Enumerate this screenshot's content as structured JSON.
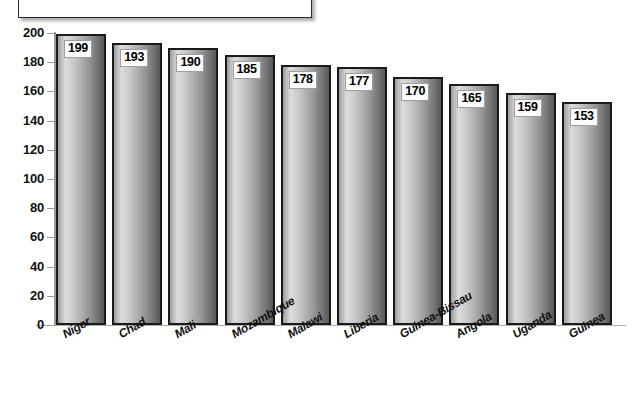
{
  "title_box": {
    "text": ""
  },
  "footnote": {
    "text": ""
  },
  "chart_data": {
    "type": "bar",
    "title": "",
    "subtitle": "",
    "xlabel": "",
    "ylabel": "",
    "categories": [
      "Niger",
      "Chad",
      "Mali",
      "Mozambique",
      "Malawi",
      "Liberia",
      "Guinea-Bissau",
      "Angola",
      "Uganda",
      "Guinea"
    ],
    "values": [
      199,
      193,
      190,
      185,
      178,
      177,
      170,
      165,
      159,
      153
    ],
    "data_labels": [
      "199",
      "193",
      "190",
      "185",
      "178",
      "177",
      "170",
      "165",
      "159",
      "153"
    ],
    "ylim": [
      0,
      200
    ],
    "ytick_labels": [
      "200",
      "180",
      "160",
      "140",
      "120",
      "100",
      "80",
      "60",
      "40",
      "20",
      "0"
    ],
    "ytick_values": [
      200,
      180,
      160,
      140,
      120,
      100,
      80,
      60,
      40,
      20,
      0
    ],
    "grid": false,
    "legend": "none",
    "bar_label_rotation": -30,
    "colors": {
      "bar_border": "#1a1a1a",
      "bar_gradient_light": "#dcdcdc",
      "bar_gradient_dark": "#5a5a5a",
      "axis": "#9a9a9a",
      "text": "#111111",
      "label_box_bg": "#fbfbfb",
      "label_box_border": "#9e9e9e",
      "background": "#ffffff"
    }
  }
}
